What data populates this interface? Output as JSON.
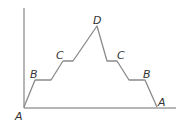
{
  "diagram": {
    "type": "profile-line",
    "line_color": "#8a8a8a",
    "axis_color": "#6e6e6e",
    "labels": {
      "origin_a": "A",
      "left_b": "B",
      "left_c": "C",
      "peak_d": "D",
      "right_c": "C",
      "right_b": "B",
      "right_a": "A"
    }
  }
}
